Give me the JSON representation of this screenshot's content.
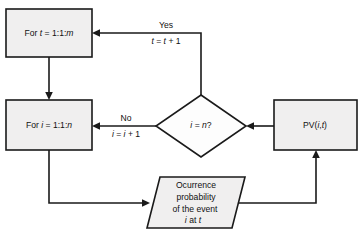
{
  "diagram": {
    "colors": {
      "node_fill": "#f0efef",
      "decision_fill": "#fdfdfd",
      "stroke": "#1a1a1a",
      "text": "#111111",
      "background": "#ffffff"
    },
    "nodes": {
      "outer_loop": {
        "shape": "process",
        "label": "For t = 1:1:m",
        "text_prefix": "For ",
        "var_t": "t",
        "text_mid": " = 1:1:",
        "var_m": "m"
      },
      "inner_loop": {
        "shape": "process",
        "label": "For i = 1:1:n",
        "text_prefix": "For ",
        "var_i": "i",
        "text_mid": " = 1:1:",
        "var_n": "n"
      },
      "decision": {
        "shape": "decision",
        "label": "i = n?",
        "var_i": "i",
        "text_mid": " = ",
        "var_n": "n",
        "text_suffix": "?"
      },
      "pv": {
        "shape": "process",
        "label": "PV(i,t)",
        "text_prefix": "PV(",
        "var_i": "i",
        "text_mid": ",",
        "var_t": "t",
        "text_suffix": ")"
      },
      "output": {
        "shape": "parallelogram-data",
        "line1": "Ocurrence",
        "line2": "probability",
        "line3": "of the event",
        "line4_var_i": "i",
        "line4_mid": " at ",
        "line4_var_t": "t"
      }
    },
    "edge_labels": {
      "yes": {
        "label": "Yes",
        "increment_var": "t",
        "increment_mid": " = ",
        "increment_var2": "t",
        "increment_suffix": " + 1"
      },
      "no": {
        "label": "No",
        "increment_var": "i",
        "increment_mid": " = ",
        "increment_var2": "i",
        "increment_suffix": " + 1"
      }
    }
  }
}
